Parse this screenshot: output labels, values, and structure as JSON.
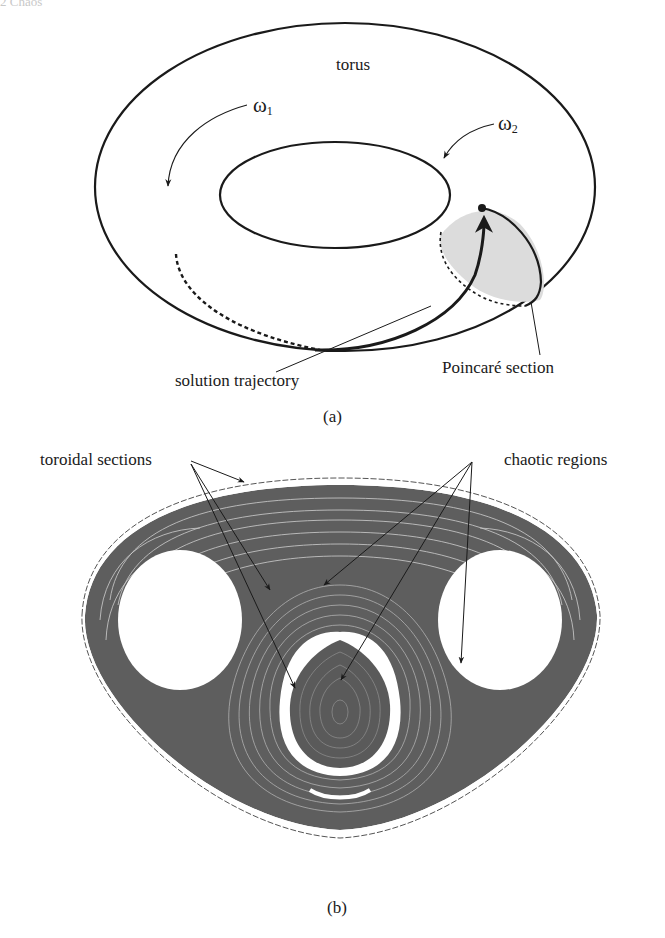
{
  "header": {
    "running_head": "2 Chaos"
  },
  "panel_a": {
    "caption": "(a)",
    "labels": {
      "torus": "torus",
      "omega1": "ω",
      "omega1_sub": "1",
      "omega2": "ω",
      "omega2_sub": "2",
      "trajectory": "solution trajectory",
      "poincare": "Poincaré section"
    },
    "colors": {
      "stroke": "#1a1a1a",
      "section_fill": "#dcdcdc"
    }
  },
  "panel_b": {
    "caption": "(b)",
    "labels": {
      "toroidal": "toroidal sections",
      "chaotic": "chaotic regions"
    },
    "colors": {
      "orbit": "#4a4a4a",
      "dense": "#5a5a5a",
      "outline": "#333333"
    }
  }
}
